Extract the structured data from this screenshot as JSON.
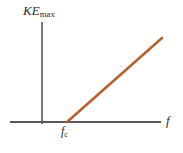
{
  "chart_data": {
    "type": "line",
    "title": "",
    "xlabel": "f",
    "ylabel": "KE",
    "ylabel_sub": "max",
    "grid": false,
    "legend": null,
    "xlim": [
      0,
      1
    ],
    "ylim": [
      0,
      1
    ],
    "annotations": [
      {
        "name": "cutoff-frequency",
        "text": "f",
        "sub": "c",
        "x": 0.37,
        "y": 0.0
      }
    ],
    "series": [
      {
        "name": "photoelectron-max-kinetic-energy",
        "color": "#b5622e",
        "x": [
          0.37,
          1.0
        ],
        "y": [
          0.0,
          0.84
        ],
        "points": [
          {
            "x": 67,
            "y": 122
          },
          {
            "x": 162,
            "y": 38
          }
        ]
      }
    ],
    "axes": {
      "color": "#595959",
      "y_axis": {
        "x": 42,
        "y_top": 22,
        "y_bottom": 124
      },
      "x_axis": {
        "y": 122,
        "x_left": 10,
        "x_right": 161
      }
    }
  },
  "figure": {
    "background": "#ffffff",
    "y_axis_label_main": "KE",
    "y_axis_label_sub": "max",
    "x_axis_label": "f",
    "cutoff_label_main": "f",
    "cutoff_label_sub": "c",
    "line_color": "#b5622e",
    "axis_color": "#595959"
  }
}
